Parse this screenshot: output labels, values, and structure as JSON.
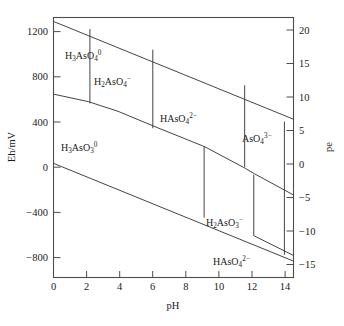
{
  "figure": {
    "title": "",
    "background": "#ffffff",
    "line_color": "#3a3a3a",
    "text_color": "#1a1a1a"
  },
  "chart_data": {
    "type": "line",
    "title": "",
    "xlabel": "pH",
    "ylabel": "Eh/mV",
    "y2label": "pe",
    "xlim": [
      0,
      14.5
    ],
    "ylim": [
      -1000,
      1300
    ],
    "y2lim": [
      -16.9,
      21.98
    ],
    "grid": false,
    "legend": "none",
    "xticks": [
      0,
      2,
      4,
      6,
      8,
      10,
      12,
      14
    ],
    "xticklabels": [
      "0",
      "2",
      "4",
      "6",
      "8",
      "10",
      "12",
      "14"
    ],
    "yticks": [
      1200,
      800,
      400,
      0,
      -400,
      -800
    ],
    "yticklabels": [
      "1200",
      "800",
      "400",
      "0",
      "−400",
      "−800"
    ],
    "y2ticks": [
      20,
      15,
      10,
      5,
      0,
      -5,
      -10,
      -15
    ],
    "y2ticklabels": [
      "20",
      "15",
      "10",
      "5",
      "0",
      "−5",
      "−10",
      "−15"
    ],
    "annotations": [
      {
        "name": "h3aso4",
        "text_parts": [
          "H",
          "3",
          "AsO",
          "4",
          "0"
        ],
        "x": 1.35,
        "y": 990
      },
      {
        "name": "h2aso4",
        "text_parts": [
          "H",
          "2",
          "AsO",
          "4",
          "−"
        ],
        "x": 4.1,
        "y": 760
      },
      {
        "name": "haso4_2minus",
        "text_parts": [
          "HAsO",
          "4",
          "2−"
        ],
        "x": 8.1,
        "y": 430
      },
      {
        "name": "aso4_3minus",
        "text_parts": [
          "AsO",
          "4",
          "3−"
        ],
        "x": 12.55,
        "y": 250
      },
      {
        "name": "h3aso3",
        "text_parts": [
          "H",
          "3",
          "AsO",
          "3",
          "0"
        ],
        "x": 2.55,
        "y": 165
      },
      {
        "name": "h2aso3_minus",
        "text_parts": [
          "H",
          "2",
          "AsO",
          "3",
          "−"
        ],
        "x": 10.1,
        "y": -355
      },
      {
        "name": "haso4_bottom",
        "text_parts": [
          "HAsO",
          "4",
          "2−"
        ],
        "x": 10.7,
        "y": -700
      }
    ],
    "series": [
      {
        "name": "upper-water-stability-line",
        "points": [
          [
            0,
            1265
          ],
          [
            14.5,
            400
          ]
        ]
      },
      {
        "name": "lower-water-stability-line",
        "points": [
          [
            0,
            10
          ],
          [
            14.5,
            -855
          ]
        ]
      },
      {
        "name": "arsenate-arsenite-redox-boundary",
        "points": [
          [
            0,
            622
          ],
          [
            2.1,
            556
          ],
          [
            3.9,
            470
          ],
          [
            6.2,
            330
          ],
          [
            9.0,
            165
          ],
          [
            9.2,
            152
          ],
          [
            11.6,
            -35
          ],
          [
            12.15,
            -83
          ],
          [
            14.5,
            -270
          ]
        ]
      },
      {
        "name": "h3aso4-h2aso4-vertical",
        "points": [
          [
            2.2,
            1198
          ],
          [
            2.2,
            540
          ]
        ]
      },
      {
        "name": "h2aso4-haso4-vertical",
        "points": [
          [
            6.0,
            1015
          ],
          [
            6.0,
            320
          ]
        ]
      },
      {
        "name": "haso4-aso4-vertical",
        "points": [
          [
            11.55,
            700
          ],
          [
            11.55,
            -22
          ]
        ]
      },
      {
        "name": "h3aso3-h2aso3-vertical",
        "points": [
          [
            9.1,
            160
          ],
          [
            9.1,
            -470
          ]
        ]
      },
      {
        "name": "h2aso3-haso3-vertical",
        "points": [
          [
            12.1,
            -90
          ],
          [
            12.1,
            -630
          ]
        ]
      },
      {
        "name": "lower-arsenite-boundary-right",
        "points": [
          [
            12.1,
            -630
          ],
          [
            14.5,
            -805
          ]
        ]
      },
      {
        "name": "aso4-right-edge-vertical",
        "points": [
          [
            13.95,
            380
          ],
          [
            13.95,
            -800
          ]
        ]
      }
    ]
  },
  "axes": {
    "left": {
      "label": "Eh/mV",
      "name": "eh-axis"
    },
    "right": {
      "label": "pe",
      "name": "pe-axis"
    },
    "bottom": {
      "label": "pH",
      "name": "ph-axis"
    }
  }
}
